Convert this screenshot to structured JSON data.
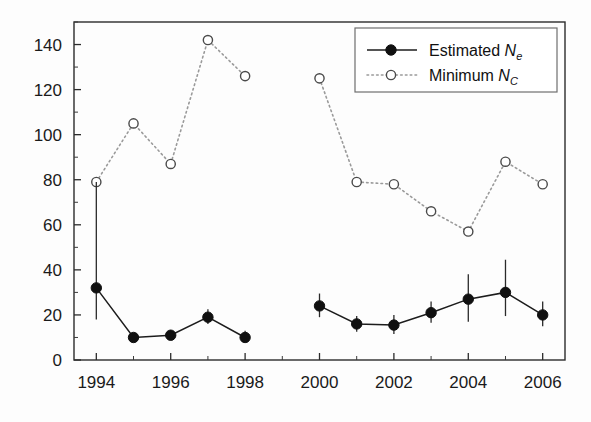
{
  "chart_data": {
    "type": "line",
    "title": "",
    "subtitle": "",
    "xlabel": "",
    "ylabel": "",
    "xlim": [
      1993.4,
      2006.6
    ],
    "ylim": [
      0,
      150
    ],
    "grid": false,
    "legend_position": "top-right",
    "x": [
      1994,
      1995,
      1996,
      1997,
      1998,
      2000,
      2001,
      2002,
      2003,
      2004,
      2005,
      2006
    ],
    "xticks": [
      1994,
      1996,
      1998,
      2000,
      2002,
      2004,
      2006
    ],
    "xtick_labels": [
      "1994",
      "1996",
      "1998",
      "2000",
      "2002",
      "2004",
      "2006"
    ],
    "x_minor_ticks": [
      1995,
      1997,
      1999,
      2001,
      2003,
      2005
    ],
    "yticks": [
      0,
      20,
      40,
      60,
      80,
      100,
      120,
      140
    ],
    "ytick_labels": [
      "0",
      "20",
      "40",
      "60",
      "80",
      "100",
      "120",
      "140"
    ],
    "y_minor_ticks": [
      10,
      30,
      50,
      70,
      90,
      110,
      130,
      150
    ],
    "series": [
      {
        "name": "Estimated Ne",
        "label_main": "Estimated ",
        "label_symbol": "N",
        "label_subscript": "e",
        "marker": "filled-circle",
        "line_style": "solid",
        "color": "#101010",
        "has_error_bars": true,
        "values": [
          32,
          10,
          11,
          19,
          10,
          24,
          16,
          15.5,
          21,
          27,
          30,
          20
        ],
        "error_low": [
          18,
          8.5,
          9,
          16,
          8,
          19,
          12.5,
          11.5,
          16.5,
          17,
          19.5,
          15
        ],
        "error_high": [
          79,
          11.5,
          13,
          22.5,
          13,
          29.5,
          19.5,
          20,
          26,
          38,
          44.5,
          26
        ],
        "gap_after_x": 1998
      },
      {
        "name": "Minimum NC",
        "label_main": "Minimum ",
        "label_symbol": "N",
        "label_subscript": "C",
        "marker": "open-circle",
        "line_style": "dotted",
        "color": "#9a9a9a",
        "has_error_bars": false,
        "values": [
          79,
          105,
          87,
          142,
          126,
          125,
          79,
          78,
          66,
          57,
          88,
          78
        ],
        "gap_after_x": 1998
      }
    ]
  },
  "legend": {
    "entries": [
      {
        "text_main": "Estimated ",
        "symbol": "N",
        "subscript": "e"
      },
      {
        "text_main": "Minimum ",
        "symbol": "N",
        "subscript": "C"
      }
    ]
  }
}
